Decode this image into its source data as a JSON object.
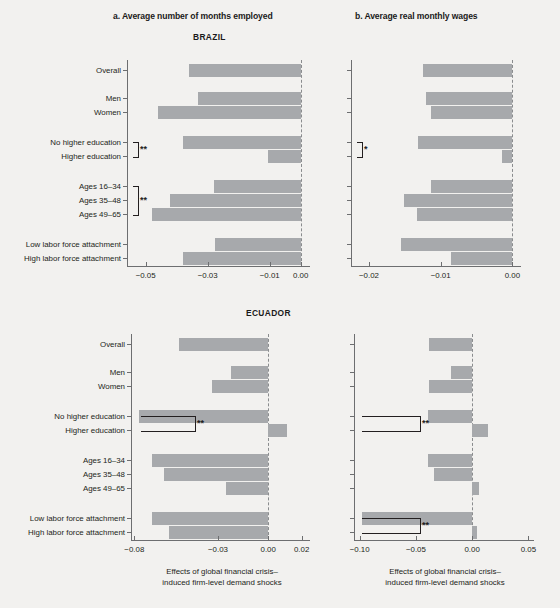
{
  "figure": {
    "panel_a_title": "a. Average number of months employed",
    "panel_b_title": "b. Average real monthly wages",
    "country_top": "BRAZIL",
    "country_bottom": "ECUADOR",
    "axis_caption_line1": "Effects of global financial crisis–",
    "axis_caption_line2": "induced firm-level demand shocks",
    "bar_color": "#a7a9ac",
    "zero_line_color": "#8a8c8e",
    "axis_color": "#6d6e70",
    "background": "#f2f1ef"
  },
  "categories": [
    "Overall",
    "Men",
    "Women",
    "No higher education",
    "Higher education",
    "Ages 16–34",
    "Ages 35–48",
    "Ages 49–65",
    "Low labor force attachment",
    "High labor force attachment"
  ],
  "chart_data": [
    {
      "id": "brazil-months",
      "type": "bar",
      "orientation": "horizontal",
      "title": "a. Average number of months employed",
      "group": "BRAZIL",
      "xlabel": "Effects of global financial crisis–induced firm-level demand shocks",
      "ylabel": "",
      "xlim": [
        -0.056,
        0.003
      ],
      "xticks": [
        -0.05,
        -0.03,
        -0.01,
        0.0
      ],
      "xticklabels": [
        "−0.05",
        "−0.03",
        "−0.01",
        "0.00"
      ],
      "grid": false,
      "legend": null,
      "categories": [
        "Overall",
        "Men",
        "Women",
        "No higher education",
        "Higher education",
        "Ages 16–34",
        "Ages 35–48",
        "Ages 49–65",
        "Low labor force attachment",
        "High labor force attachment"
      ],
      "values": [
        -0.036,
        -0.033,
        -0.046,
        -0.038,
        -0.0105,
        -0.028,
        -0.042,
        -0.048,
        -0.0275,
        -0.038
      ],
      "annotations": [
        {
          "label": "**",
          "between": [
            "No higher education",
            "Higher education"
          ]
        },
        {
          "label": "**",
          "between": [
            "Ages 16–34",
            "Ages 49–65"
          ]
        }
      ]
    },
    {
      "id": "brazil-wages",
      "type": "bar",
      "orientation": "horizontal",
      "title": "b. Average real monthly wages",
      "group": "BRAZIL",
      "xlabel": "Effects of global financial crisis–induced firm-level demand shocks",
      "ylabel": "",
      "xlim": [
        -0.0225,
        0.0012
      ],
      "xticks": [
        -0.02,
        -0.01,
        0.0
      ],
      "xticklabels": [
        "−0.02",
        "−0.01",
        "0.00"
      ],
      "grid": false,
      "legend": null,
      "categories": [
        "Overall",
        "Men",
        "Women",
        "No higher education",
        "Higher education",
        "Ages 16–34",
        "Ages 35–48",
        "Ages 49–65",
        "Low labor force attachment",
        "High labor force attachment"
      ],
      "values": [
        -0.0124,
        -0.0121,
        -0.0114,
        -0.0131,
        -0.0015,
        -0.0113,
        -0.0151,
        -0.0133,
        -0.0155,
        -0.0086
      ],
      "annotations": [
        {
          "label": "*",
          "between": [
            "No higher education",
            "Higher education"
          ]
        }
      ]
    },
    {
      "id": "ecuador-months",
      "type": "bar",
      "orientation": "horizontal",
      "title": "a. Average number of months employed",
      "group": "ECUADOR",
      "xlabel": "Effects of global financial crisis–induced firm-level demand shocks",
      "ylabel": "",
      "xlim": [
        -0.082,
        0.025
      ],
      "xticks": [
        -0.08,
        -0.03,
        0.0,
        0.02
      ],
      "xticklabels": [
        "−0.08",
        "−0.03",
        "0.00",
        "0.02"
      ],
      "grid": false,
      "legend": null,
      "categories": [
        "Overall",
        "Men",
        "Women",
        "No higher education",
        "Higher education",
        "Ages 16–34",
        "Ages 35–48",
        "Ages 49–65",
        "Low labor force attachment",
        "High labor force attachment"
      ],
      "values": [
        -0.0535,
        -0.0225,
        -0.0335,
        -0.0775,
        0.0115,
        -0.0695,
        -0.0625,
        -0.0255,
        -0.0695,
        -0.059
      ],
      "annotations": [
        {
          "label": "**",
          "between": [
            "No higher education",
            "Higher education"
          ]
        }
      ]
    },
    {
      "id": "ecuador-wages",
      "type": "bar",
      "orientation": "horizontal",
      "title": "b. Average real monthly wages",
      "group": "ECUADOR",
      "xlabel": "Effects of global financial crisis–induced firm-level demand shocks",
      "ylabel": "",
      "xlim": [
        -0.105,
        0.055
      ],
      "xticks": [
        -0.1,
        -0.05,
        0.0,
        0.05
      ],
      "xticklabels": [
        "−0.10",
        "−0.05",
        "0.00",
        "0.05"
      ],
      "grid": false,
      "legend": null,
      "categories": [
        "Overall",
        "Men",
        "Women",
        "No higher education",
        "Higher education",
        "Ages 16–34",
        "Ages 35–48",
        "Ages 49–65",
        "Low labor force attachment",
        "High labor force attachment"
      ],
      "values": [
        -0.038,
        -0.019,
        -0.038,
        -0.039,
        0.014,
        -0.039,
        -0.034,
        0.006,
        -0.098,
        0.004
      ],
      "annotations": [
        {
          "label": "**",
          "between": [
            "No higher education",
            "Higher education"
          ]
        },
        {
          "label": "**",
          "between": [
            "Low labor force attachment",
            "High labor force attachment"
          ]
        }
      ]
    }
  ]
}
